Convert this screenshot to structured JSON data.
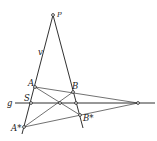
{
  "diagram": {
    "type": "projective-geometry-construction",
    "labels": {
      "P": "P",
      "v": "v",
      "A": "A",
      "B": "B",
      "S": "S",
      "g": "g",
      "A_star": "A*",
      "B_star": "B*"
    },
    "points": {
      "P": [
        53,
        15
      ],
      "A": [
        35,
        87
      ],
      "B": [
        73,
        92
      ],
      "S": [
        31,
        103
      ],
      "M": [
        60,
        103
      ],
      "G": [
        76,
        103
      ],
      "V": [
        138,
        103
      ],
      "B_star": [
        80,
        115
      ],
      "A_star": [
        24,
        127
      ]
    },
    "colors": {
      "stroke": "#1a1a1a",
      "background": "#ffffff"
    }
  }
}
